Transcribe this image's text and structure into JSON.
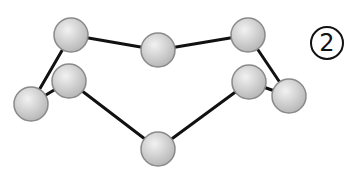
{
  "diagram": {
    "label": "2",
    "atom_fill_light": "#f2f2f2",
    "atom_fill_dark": "#b8b8b8",
    "atom_stroke": "#8a8a8a",
    "bond_color": "#111111",
    "atoms": [
      {
        "id": "A",
        "x": 71,
        "y": 35,
        "r": 17
      },
      {
        "id": "B",
        "x": 158,
        "y": 50,
        "r": 17
      },
      {
        "id": "C",
        "x": 248,
        "y": 35,
        "r": 17
      },
      {
        "id": "D",
        "x": 31,
        "y": 104,
        "r": 17
      },
      {
        "id": "E",
        "x": 69,
        "y": 81,
        "r": 17
      },
      {
        "id": "F",
        "x": 158,
        "y": 149,
        "r": 17
      },
      {
        "id": "G",
        "x": 249,
        "y": 82,
        "r": 17
      },
      {
        "id": "H",
        "x": 289,
        "y": 96,
        "r": 17
      }
    ],
    "bonds": [
      [
        "A",
        "B"
      ],
      [
        "B",
        "C"
      ],
      [
        "A",
        "D"
      ],
      [
        "D",
        "E"
      ],
      [
        "E",
        "F"
      ],
      [
        "F",
        "G"
      ],
      [
        "G",
        "H"
      ],
      [
        "C",
        "H"
      ]
    ]
  }
}
